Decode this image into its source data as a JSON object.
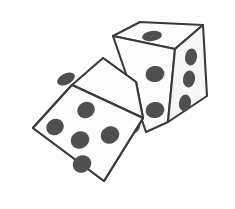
{
  "image": {
    "title": "Two dice",
    "subject": "pair-of-dice",
    "style": "hand-drawn line illustration",
    "background_color": "#ffffff",
    "outline_color": "#3a3a3a",
    "face_color": "#fdfdfd",
    "shaded_face_color": "#f6f6f6",
    "pip_color": "#4f4f4f",
    "total_pips_visible": 15,
    "dice_count": 2
  },
  "dice": [
    {
      "id": "left-die",
      "label": "Left front die",
      "position": "lower-left, foreground",
      "faces": [
        {
          "id": "left-die-front",
          "label": "Front face",
          "pip_count": 5,
          "pip_pattern": "quincunx",
          "polygon": "33,128 72,85 143,118 104,181",
          "pips": [
            {
              "cx": 55,
              "cy": 127,
              "rx": 9.0,
              "ry": 8.0,
              "angle": -28
            },
            {
              "cx": 86,
              "cy": 110,
              "rx": 9.0,
              "ry": 8.0,
              "angle": -28
            },
            {
              "cx": 80,
              "cy": 140,
              "rx": 9.5,
              "ry": 8.5,
              "angle": -28
            },
            {
              "cx": 110,
              "cy": 135,
              "rx": 9.5,
              "ry": 8.5,
              "angle": -28
            },
            {
              "cx": 82,
              "cy": 164,
              "rx": 9.5,
              "ry": 8.5,
              "angle": -28
            }
          ]
        },
        {
          "id": "left-die-top",
          "label": "Top face",
          "pip_count": 1,
          "pip_pattern": "center",
          "polygon": "33,128 72,85 103,58 136,82 143,118 72,85",
          "pips": [
            {
              "cx": 66,
              "cy": 79,
              "rx": 9.5,
              "ry": 5.5,
              "angle": -26
            }
          ]
        },
        {
          "id": "left-die-right",
          "label": "Right face",
          "pip_count": 3,
          "pip_pattern": "diagonal",
          "polygon": "103,58 136,82 143,118 104,181",
          "pips": [
            {
              "cx": 118,
              "cy": 78,
              "rx": 6.5,
              "ry": 8.5,
              "angle": 12
            },
            {
              "cx": 128,
              "cy": 101,
              "rx": 6.5,
              "ry": 8.5,
              "angle": 12
            },
            {
              "cx": 134,
              "cy": 125,
              "rx": 6.5,
              "ry": 8.5,
              "angle": 12
            }
          ]
        }
      ]
    },
    {
      "id": "right-die",
      "label": "Right back die",
      "position": "upper-right, background",
      "faces": [
        {
          "id": "right-die-top",
          "label": "Top face",
          "pip_count": 1,
          "pip_pattern": "center",
          "polygon": "113,36 140,22 203,25 175,49",
          "pips": [
            {
              "cx": 152,
              "cy": 36,
              "rx": 10.0,
              "ry": 5.0,
              "angle": -8
            }
          ]
        },
        {
          "id": "right-die-front",
          "label": "Front left face",
          "pip_count": 2,
          "pip_pattern": "diagonal-pair",
          "polygon": "113,36 175,49 168,122 146,132",
          "pips": [
            {
              "cx": 155,
              "cy": 74,
              "rx": 9.5,
              "ry": 8.0,
              "angle": -10
            },
            {
              "cx": 155,
              "cy": 110,
              "rx": 9.5,
              "ry": 8.0,
              "angle": -10
            }
          ]
        },
        {
          "id": "right-die-right",
          "label": "Right face",
          "pip_count": 3,
          "pip_pattern": "vertical-column",
          "polygon": "175,49 203,25 207,96 168,122",
          "pips": [
            {
              "cx": 191,
              "cy": 57,
              "rx": 6.0,
              "ry": 8.5,
              "angle": 8
            },
            {
              "cx": 189,
              "cy": 79,
              "rx": 6.0,
              "ry": 8.5,
              "angle": 8
            },
            {
              "cx": 185,
              "cy": 103,
              "rx": 6.0,
              "ry": 8.5,
              "angle": 8
            }
          ]
        }
      ]
    }
  ]
}
